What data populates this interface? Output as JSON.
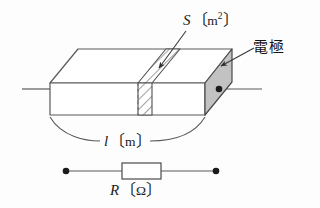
{
  "figure": {
    "labels": {
      "area": {
        "symbol": "S",
        "bracket_open": "〔",
        "unit": "m",
        "superscript": "2",
        "bracket_close": "〕",
        "full": "S〔m²〕"
      },
      "electrode": {
        "text": "電極",
        "romaji_meaning": "electrode"
      },
      "length": {
        "symbol": "l",
        "bracket_open": "〔",
        "unit": "m",
        "bracket_close": "〕",
        "full": "l〔m〕"
      },
      "resistance": {
        "symbol": "R",
        "bracket_open": "〔",
        "unit": "Ω",
        "bracket_close": "〕",
        "full": "R〔Ω〕"
      }
    },
    "colors": {
      "line": "#5a5a5a",
      "line_dark": "#2e2e2e",
      "electrode_fill": "#c2c2c2",
      "hatch_fill": "#ffffff",
      "background": "#fdfdfd",
      "text": "#1b1b1b"
    },
    "shapes": {
      "block_label": "conductor-block",
      "cross_section_label": "hatched-cross-section",
      "electrode_face_label": "shaded-electrode-face",
      "circuit_label": "resistor-circuit"
    }
  }
}
